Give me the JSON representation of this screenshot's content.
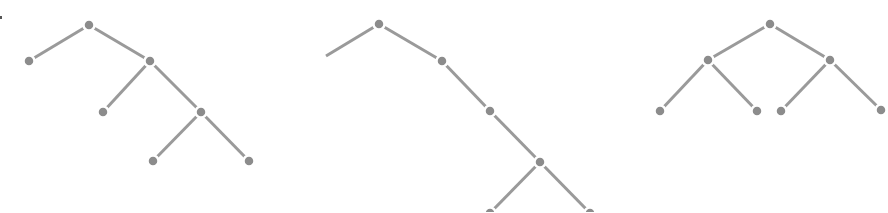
{
  "diagram": {
    "type": "tree-diagrams",
    "colors": {
      "background": "#ffffff",
      "edge": "#9a9a9a",
      "node": "#8c8c8c"
    },
    "node_radius": 5.5,
    "trees": [
      {
        "id": "tree-left",
        "nodes": [
          {
            "id": "a",
            "x": 89,
            "y": 25
          },
          {
            "id": "b",
            "x": 29,
            "y": 61
          },
          {
            "id": "c",
            "x": 150,
            "y": 61
          },
          {
            "id": "d",
            "x": 103,
            "y": 112
          },
          {
            "id": "e",
            "x": 201,
            "y": 112
          },
          {
            "id": "f",
            "x": 153,
            "y": 161
          },
          {
            "id": "g",
            "x": 249,
            "y": 161
          }
        ],
        "edges": [
          [
            "a",
            "b"
          ],
          [
            "a",
            "c"
          ],
          [
            "c",
            "d"
          ],
          [
            "c",
            "e"
          ],
          [
            "e",
            "f"
          ],
          [
            "e",
            "g"
          ]
        ],
        "dangling": []
      },
      {
        "id": "tree-middle",
        "nodes": [
          {
            "id": "a",
            "x": 379,
            "y": 24
          },
          {
            "id": "c",
            "x": 442,
            "y": 61
          },
          {
            "id": "e",
            "x": 490,
            "y": 111
          },
          {
            "id": "g",
            "x": 540,
            "y": 162
          },
          {
            "id": "h",
            "x": 490,
            "y": 213
          },
          {
            "id": "i",
            "x": 590,
            "y": 213
          }
        ],
        "edges": [
          [
            "a",
            "c"
          ],
          [
            "c",
            "e"
          ],
          [
            "e",
            "g"
          ],
          [
            "g",
            "h"
          ],
          [
            "g",
            "i"
          ]
        ],
        "dangling": [
          {
            "from": "a",
            "x": 326,
            "y": 56
          }
        ]
      },
      {
        "id": "tree-right",
        "nodes": [
          {
            "id": "a",
            "x": 770,
            "y": 24
          },
          {
            "id": "b",
            "x": 708,
            "y": 60
          },
          {
            "id": "c",
            "x": 830,
            "y": 60
          },
          {
            "id": "d",
            "x": 660,
            "y": 111
          },
          {
            "id": "e",
            "x": 757,
            "y": 111
          },
          {
            "id": "f",
            "x": 781,
            "y": 111
          },
          {
            "id": "g",
            "x": 881,
            "y": 110
          }
        ],
        "edges": [
          [
            "a",
            "b"
          ],
          [
            "a",
            "c"
          ],
          [
            "b",
            "d"
          ],
          [
            "b",
            "e"
          ],
          [
            "c",
            "f"
          ],
          [
            "c",
            "g"
          ]
        ],
        "dangling": []
      }
    ]
  }
}
